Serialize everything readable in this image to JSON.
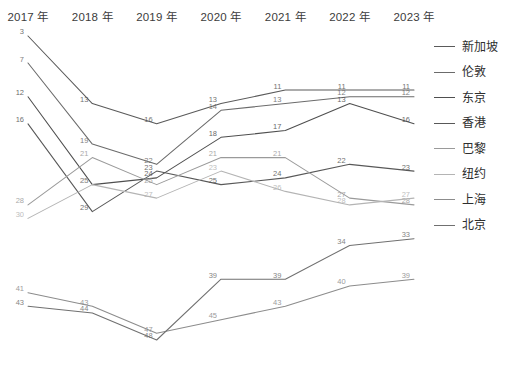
{
  "chart_data": {
    "type": "line",
    "title": "",
    "subtitle": "",
    "xlabel": "",
    "ylabel": "",
    "grid": false,
    "legend_position": "right",
    "axis_top": true,
    "y_inverted": true,
    "ylim": [
      1,
      50
    ],
    "categories": [
      "2017 年",
      "2018 年",
      "2019 年",
      "2020 年",
      "2021 年",
      "2022 年",
      "2023 年"
    ],
    "value_labels_shown": true,
    "series": [
      {
        "name": "新加坡",
        "color": "#5a5a5a",
        "values": [
          3,
          13,
          16,
          13,
          11,
          11,
          11
        ]
      },
      {
        "name": "伦敦",
        "color": "#6b6b6b",
        "values": [
          7,
          19,
          22,
          14,
          13,
          12,
          12
        ]
      },
      {
        "name": "东京",
        "color": "#4f4f4f",
        "values": [
          12,
          25,
          24,
          18,
          17,
          13,
          16
        ]
      },
      {
        "name": "香港",
        "color": "#585858",
        "values": [
          16,
          29,
          23,
          25,
          24,
          22,
          23
        ]
      },
      {
        "name": "巴黎",
        "color": "#9a9a9a",
        "values": [
          28,
          21,
          25,
          21,
          21,
          27,
          28
        ]
      },
      {
        "name": "纽约",
        "color": "#b4b4b4",
        "values": [
          30,
          25,
          27,
          23,
          26,
          28,
          27
        ]
      },
      {
        "name": "上海",
        "color": "#8c8c8c",
        "values": [
          41,
          43,
          47,
          45,
          43,
          40,
          39
        ]
      },
      {
        "name": "北京",
        "color": "#707070",
        "values": [
          43,
          44,
          48,
          39,
          39,
          34,
          33
        ]
      }
    ]
  },
  "axis": {
    "labels": [
      {
        "text": "2017 年"
      },
      {
        "text": "2018 年"
      },
      {
        "text": "2019 年"
      },
      {
        "text": "2020 年"
      },
      {
        "text": "2021 年"
      },
      {
        "text": "2022 年"
      },
      {
        "text": "2023 年"
      }
    ]
  },
  "legend": {
    "items": [
      {
        "label": "新加坡",
        "color": "#5a5a5a"
      },
      {
        "label": "伦敦",
        "color": "#6b6b6b"
      },
      {
        "label": "东京",
        "color": "#4f4f4f"
      },
      {
        "label": "香港",
        "color": "#585858"
      },
      {
        "label": "巴黎",
        "color": "#9a9a9a"
      },
      {
        "label": "纽约",
        "color": "#b4b4b4"
      },
      {
        "label": "上海",
        "color": "#8c8c8c"
      },
      {
        "label": "北京",
        "color": "#707070"
      }
    ]
  }
}
